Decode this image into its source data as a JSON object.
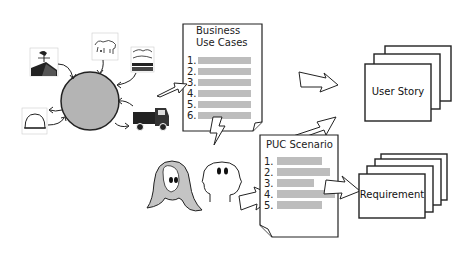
{
  "diagram": {
    "business_use_cases": {
      "title_line1": "Business",
      "title_line2": "Use Cases",
      "items": [
        "1.",
        "2.",
        "3.",
        "4.",
        "5.",
        "6."
      ]
    },
    "puc_scenario": {
      "title": "PUC Scenario",
      "items": [
        "1.",
        "2.",
        "3.",
        "4.",
        "5."
      ]
    },
    "user_story": {
      "label": "User Story"
    },
    "requirement": {
      "label": "Requirement"
    },
    "business_icons": [
      "weathervane-house-icon",
      "cow-icon",
      "landscape-icon",
      "truck-icon",
      "hardhat-icon"
    ],
    "colors": {
      "circle_fill": "#b4b4b4",
      "bar_fill": "#bdbdbd",
      "hair_fill": "#c4c4c4",
      "stroke": "#111111"
    }
  }
}
